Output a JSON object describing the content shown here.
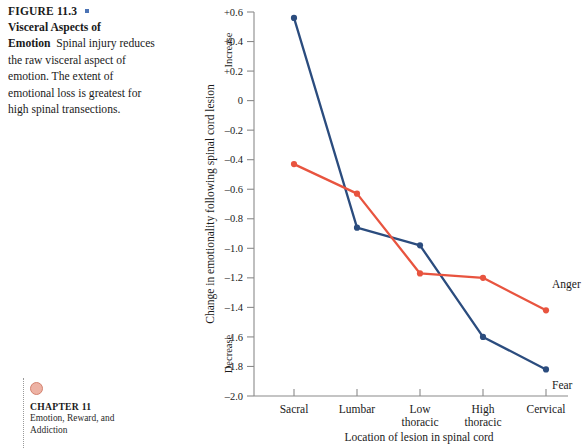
{
  "figure": {
    "label": "FIGURE 11.3",
    "bullet_color": "#4b73b5",
    "title": "Visceral Aspects of Emotion",
    "caption": "Spinal injury reduces the raw visceral aspect of emotion. The extent of emotional loss is greatest for high spinal transections."
  },
  "chapter_marker": {
    "number": "CHAPTER 11",
    "subtitle": "Emotion, Reward, and Addiction",
    "dot_color": "#edb2a4"
  },
  "chart_data": {
    "type": "line",
    "title": "",
    "xlabel": "Location of lesion in spinal cord",
    "ylabel": "Change in emotionality following spinal cord lesion",
    "y_direction_top": "Increase",
    "y_direction_bottom": "Decrease",
    "categories": [
      "Sacral",
      "Lumbar",
      "Low thoracic",
      "High thoracic",
      "Cervical"
    ],
    "category_lines": [
      [
        "Sacral"
      ],
      [
        "Lumbar"
      ],
      [
        "Low",
        "thoracic"
      ],
      [
        "High",
        "thoracic"
      ],
      [
        "Cervical"
      ]
    ],
    "ylim": [
      -2.0,
      0.6
    ],
    "yticks": [
      0.6,
      0.4,
      0.2,
      0,
      -0.2,
      -0.4,
      -0.6,
      -0.8,
      -1.0,
      -1.2,
      -1.4,
      -1.6,
      -1.8,
      -2.0
    ],
    "ytick_labels": [
      "+0.6",
      "+0.4",
      "+0.2",
      "0",
      "–0.2",
      "–0.4",
      "–0.6",
      "–0.8",
      "–1.0",
      "–1.2",
      "–1.4",
      "–1.6",
      "–1.8",
      "–2.0"
    ],
    "grid": false,
    "legend_position": "inline-right",
    "series": [
      {
        "name": "Fear",
        "color": "#2b4c7e",
        "values": [
          0.56,
          -0.86,
          -0.98,
          -1.6,
          -1.82
        ]
      },
      {
        "name": "Anger",
        "color": "#e8543f",
        "values": [
          -0.43,
          -0.63,
          -1.17,
          -1.2,
          -1.42
        ]
      }
    ]
  }
}
